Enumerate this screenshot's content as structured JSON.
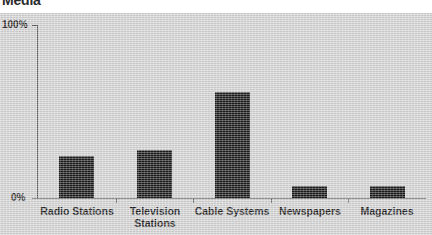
{
  "chart": {
    "title": "Media",
    "y_axis": {
      "top_label": "100%",
      "bottom_label": "0%"
    }
  },
  "chart_data": {
    "type": "bar",
    "title": "Media",
    "xlabel": "",
    "ylabel": "",
    "ylim": [
      0,
      100
    ],
    "ytick_labels": [
      "0%",
      "100%"
    ],
    "grid": false,
    "legend": "none",
    "bar_color": "#1b1b1b",
    "background_color": "#d6d6d6",
    "categories": [
      "Radio Stations",
      "Television\nStations",
      "Cable Systems",
      "Newspapers",
      "Magazines"
    ],
    "values": [
      24,
      28,
      61,
      7,
      7
    ],
    "values_unit": "%"
  }
}
